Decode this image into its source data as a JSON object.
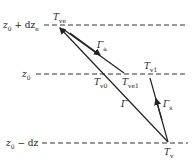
{
  "levels": {
    "top": {
      "base": "z",
      "sub": "0",
      "rest": " + dz",
      "rest_sub": "e"
    },
    "mid": {
      "base": "z",
      "sub": "0"
    },
    "bottom": {
      "base": "z",
      "sub": "0",
      "rest": " − dz"
    }
  },
  "points": {
    "T_ve": {
      "base": "T",
      "sub": "ve"
    },
    "T_v0": {
      "base": "T",
      "sub": "v0"
    },
    "T_ve1": {
      "base": "T",
      "sub": "ve1"
    },
    "T_v1": {
      "base": "T",
      "sub": "v1"
    },
    "T_v": {
      "base": "T",
      "sub": "v"
    }
  },
  "gradients": {
    "gamma_a": {
      "base": "Γ",
      "sub": "a"
    },
    "gamma": {
      "base": "Γ"
    },
    "gamma_s": {
      "base": "Γ",
      "sub": "s"
    }
  },
  "colors": {
    "line": "#222222",
    "dash": "#333333"
  }
}
